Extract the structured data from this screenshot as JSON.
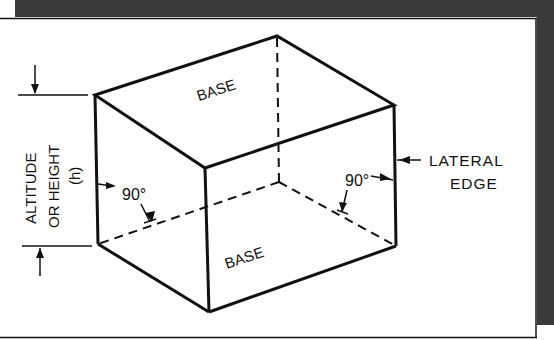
{
  "figure": {
    "labels": {
      "top_base": "BASE",
      "bottom_base": "BASE",
      "altitude_line1": "ALTITUDE",
      "altitude_line2": "OR HEIGHT",
      "altitude_line3": "(h)",
      "angle_left": "90°",
      "angle_right": "90°",
      "lateral_line1": "LATERAL",
      "lateral_line2": "EDGE"
    },
    "colors": {
      "frame_shadow": "#3a3a3a",
      "line": "#111111",
      "background": "#ffffff"
    }
  }
}
